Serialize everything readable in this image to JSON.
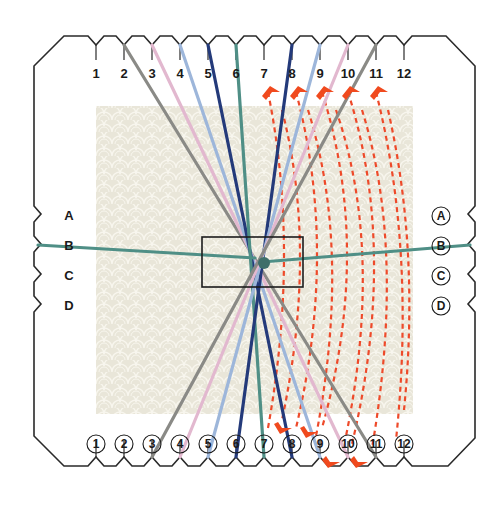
{
  "diagram": {
    "type": "kumihimo-card-braiding",
    "top_slot_labels": [
      "1",
      "2",
      "3",
      "4",
      "5",
      "6",
      "7",
      "8",
      "9",
      "10",
      "11",
      "12"
    ],
    "bottom_slot_labels": [
      "1",
      "2",
      "3",
      "4",
      "5",
      "6",
      "7",
      "8",
      "9",
      "10",
      "11",
      "12"
    ],
    "left_side_labels": [
      "A",
      "B",
      "C",
      "D"
    ],
    "right_side_labels": [
      "A",
      "B",
      "C",
      "D"
    ],
    "bottom_labels_circled": true,
    "right_labels_circled": true,
    "colors": {
      "card_outline": "#2a2a2a",
      "background_pattern": "#e9e6d9",
      "dashed_move_lines": "#ee4a2a",
      "arrow_heads": "#f04a1e",
      "center_hole_outline": "#1c1c1c"
    },
    "threads": [
      {
        "name": "gray",
        "color": "#8a8a86",
        "from_top": "2",
        "to_bottom": "11"
      },
      {
        "name": "pink",
        "color": "#e2b8cf",
        "from_top": "3",
        "to_bottom": "10"
      },
      {
        "name": "light-blue",
        "color": "#9db6da",
        "from_top": "4",
        "to_bottom": "9"
      },
      {
        "name": "navy",
        "color": "#243a7a",
        "from_top": "5",
        "to_bottom": "8"
      },
      {
        "name": "teal",
        "color": "#4f8f86",
        "from_top": "6",
        "to_bottom": "7"
      },
      {
        "name": "navy",
        "color": "#243a7a",
        "from_top": "8",
        "to_bottom": "6"
      },
      {
        "name": "light-blue",
        "color": "#9db6da",
        "from_top": "9",
        "to_bottom": "5"
      },
      {
        "name": "pink",
        "color": "#e2b8cf",
        "from_top": "10",
        "to_bottom": "4"
      },
      {
        "name": "gray",
        "color": "#8a8a86",
        "from_top": "11",
        "to_bottom": "3"
      },
      {
        "name": "teal-horizontal",
        "color": "#4f8f86",
        "from_side": "B-left",
        "to_side": "B-right"
      }
    ],
    "moves": {
      "upward_arrows_at_top_slots": [
        "7",
        "8",
        "9",
        "10",
        "11"
      ],
      "downward_arrows_at_bottom_slots": [
        "7",
        "8",
        "9",
        "10"
      ],
      "dashed_curve_count": 10
    }
  }
}
